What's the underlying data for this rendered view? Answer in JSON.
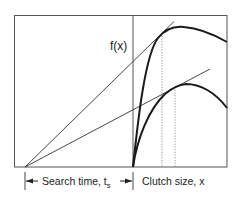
{
  "diagram": {
    "type": "marginal-value-theorem-clutch-size",
    "y_label": "f(x)",
    "left_axis_label": "Search time, t",
    "left_axis_label_subscript": "s",
    "right_axis_label": "Clutch size, x",
    "curves": [
      {
        "name": "upper-fitness-curve",
        "description": "High-yield gain curve"
      },
      {
        "name": "lower-fitness-curve",
        "description": "Lower-yield gain curve"
      }
    ],
    "tangent_lines": [
      {
        "name": "upper-tangent-line"
      },
      {
        "name": "lower-tangent-line"
      }
    ],
    "colors": {
      "line": "#222222",
      "frame": "#555555",
      "dotted": "#666666"
    }
  }
}
